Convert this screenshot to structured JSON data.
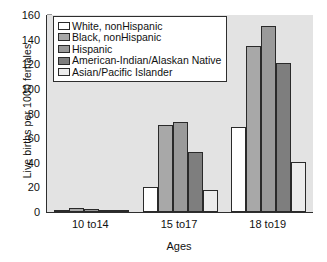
{
  "chart_data": {
    "type": "bar",
    "title": "",
    "xlabel": "Ages",
    "ylabel": "Live births per 1000 females",
    "categories": [
      "10 to14",
      "15 to17",
      "18 to19"
    ],
    "ylim": [
      0,
      160
    ],
    "yticks": [
      0,
      20,
      40,
      60,
      80,
      100,
      120,
      140,
      160
    ],
    "ytick_labels": [
      "0",
      "20",
      "40",
      "60",
      "80",
      "100",
      "120",
      "140",
      "160"
    ],
    "grid": false,
    "legend_position": "upper-left-inside",
    "series": [
      {
        "name": "White, nonHispanic",
        "color": "#ffffff",
        "values": [
          0.4,
          20.5,
          69
        ]
      },
      {
        "name": "Black, nonHispanic",
        "color": "#a8a8a8",
        "values": [
          3.2,
          70.5,
          135
        ]
      },
      {
        "name": "Hispanic",
        "color": "#9a9a9a",
        "values": [
          2.1,
          73.5,
          151
        ]
      },
      {
        "name": "American-Indian/Alaskan Native",
        "color": "#7e7e7e",
        "values": [
          1.1,
          48.5,
          121
        ]
      },
      {
        "name": "Asian/Pacific Islander",
        "color": "#ececec",
        "values": [
          0.5,
          17.8,
          41
        ]
      }
    ]
  },
  "colors": {
    "plot_background": "#e3e3e3",
    "axis": "#2e2e2e",
    "text": "#111111",
    "bar_outline": "#2a2a2a",
    "page_background": "#ffffff"
  }
}
